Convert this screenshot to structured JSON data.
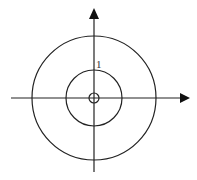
{
  "diagram": {
    "center": {
      "x": 94,
      "y": 98
    },
    "circles": [
      {
        "name": "inner-circle",
        "r": 5
      },
      {
        "name": "middle-circle",
        "r": 28
      },
      {
        "name": "outer-circle",
        "r": 62
      }
    ],
    "label": {
      "text": "1",
      "x": 95,
      "y": 68
    },
    "axes": {
      "horizontal": {
        "x1": 11,
        "x2": 182,
        "y": 98,
        "arrow": "right"
      },
      "vertical": {
        "x": 94,
        "y1": 172,
        "y2": 17,
        "arrow": "up"
      }
    },
    "stroke_color": "#222222"
  }
}
